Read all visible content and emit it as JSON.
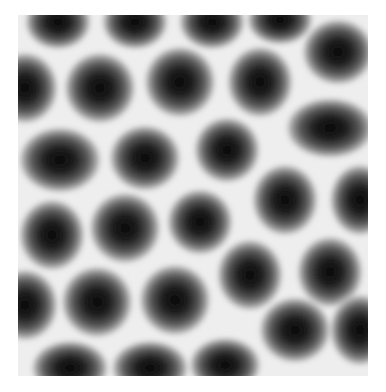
{
  "image": {
    "description": "Grayscale micrograph of a hexagonal lattice of dark circular blobs on a light background",
    "frame": {
      "x": 18,
      "y": 15,
      "width": 350,
      "height": 361
    },
    "background_color": "#eeeeee",
    "blob_color": "#111111",
    "blobs": [
      {
        "cx": 58,
        "cy": 22,
        "rx": 24,
        "ry": 20
      },
      {
        "cx": 135,
        "cy": 22,
        "rx": 24,
        "ry": 20
      },
      {
        "cx": 212,
        "cy": 22,
        "rx": 24,
        "ry": 20
      },
      {
        "cx": 280,
        "cy": 20,
        "rx": 24,
        "ry": 18
      },
      {
        "cx": 338,
        "cy": 52,
        "rx": 26,
        "ry": 24
      },
      {
        "cx": 25,
        "cy": 88,
        "rx": 24,
        "ry": 26
      },
      {
        "cx": 100,
        "cy": 88,
        "rx": 26,
        "ry": 26
      },
      {
        "cx": 180,
        "cy": 82,
        "rx": 26,
        "ry": 26
      },
      {
        "cx": 260,
        "cy": 82,
        "rx": 24,
        "ry": 26
      },
      {
        "cx": 330,
        "cy": 128,
        "rx": 32,
        "ry": 22
      },
      {
        "cx": 60,
        "cy": 160,
        "rx": 30,
        "ry": 24
      },
      {
        "cx": 145,
        "cy": 158,
        "rx": 26,
        "ry": 24
      },
      {
        "cx": 227,
        "cy": 150,
        "rx": 24,
        "ry": 24
      },
      {
        "cx": 285,
        "cy": 200,
        "rx": 24,
        "ry": 26
      },
      {
        "cx": 360,
        "cy": 200,
        "rx": 22,
        "ry": 26
      },
      {
        "cx": 52,
        "cy": 235,
        "rx": 24,
        "ry": 26
      },
      {
        "cx": 125,
        "cy": 228,
        "rx": 26,
        "ry": 26
      },
      {
        "cx": 200,
        "cy": 222,
        "rx": 24,
        "ry": 24
      },
      {
        "cx": 250,
        "cy": 275,
        "rx": 24,
        "ry": 26
      },
      {
        "cx": 330,
        "cy": 272,
        "rx": 24,
        "ry": 26
      },
      {
        "cx": 25,
        "cy": 305,
        "rx": 24,
        "ry": 26
      },
      {
        "cx": 97,
        "cy": 302,
        "rx": 26,
        "ry": 26
      },
      {
        "cx": 175,
        "cy": 300,
        "rx": 26,
        "ry": 26
      },
      {
        "cx": 295,
        "cy": 330,
        "rx": 26,
        "ry": 24
      },
      {
        "cx": 360,
        "cy": 330,
        "rx": 22,
        "ry": 26
      },
      {
        "cx": 70,
        "cy": 368,
        "rx": 28,
        "ry": 20
      },
      {
        "cx": 150,
        "cy": 368,
        "rx": 28,
        "ry": 20
      },
      {
        "cx": 225,
        "cy": 365,
        "rx": 26,
        "ry": 20
      }
    ]
  }
}
